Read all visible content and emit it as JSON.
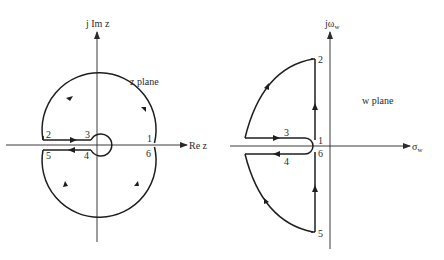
{
  "figure": {
    "left_panel": {
      "vertical_axis_label": "j Im z",
      "horizontal_axis_label": "Re z",
      "plane_label": "z plane",
      "points": [
        "1",
        "2",
        "3",
        "4",
        "5",
        "6"
      ]
    },
    "right_panel": {
      "vertical_axis_label_main": "jω",
      "vertical_axis_label_sub": "w",
      "horizontal_axis_label_main": "σ",
      "horizontal_axis_label_sub": "w",
      "plane_label": "w plane",
      "points": [
        "1",
        "2",
        "3",
        "4",
        "5",
        "6"
      ]
    }
  },
  "colors": {
    "stroke": "#1e1e1e",
    "axis": "#3a3a3a",
    "background": "#ffffff"
  }
}
